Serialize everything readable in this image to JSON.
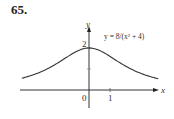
{
  "problem_number": "65.",
  "chart_data": {
    "type": "line",
    "title": "",
    "equation_label": "y = 8/(x² + 4)",
    "xlabel": "x",
    "ylabel": "y",
    "x_tick_labels": [
      "0",
      "1"
    ],
    "y_tick_labels": [
      "2"
    ],
    "y_unlabeled_ticks": [
      1
    ],
    "xlim": [
      -3.2,
      3.3
    ],
    "ylim": [
      -0.9,
      3.0
    ],
    "grid": false,
    "legend": "none",
    "series": [
      {
        "name": "y = 8/(x^2 + 4)",
        "x": [
          -3.2,
          -3,
          -2.5,
          -2,
          -1.5,
          -1,
          -0.5,
          0,
          0.5,
          1,
          1.5,
          2,
          2.5,
          3,
          3.3
        ],
        "values": [
          0.56,
          0.62,
          0.78,
          1.0,
          1.28,
          1.6,
          1.88,
          2.0,
          1.88,
          1.6,
          1.28,
          1.0,
          0.78,
          0.62,
          0.54
        ]
      }
    ]
  }
}
